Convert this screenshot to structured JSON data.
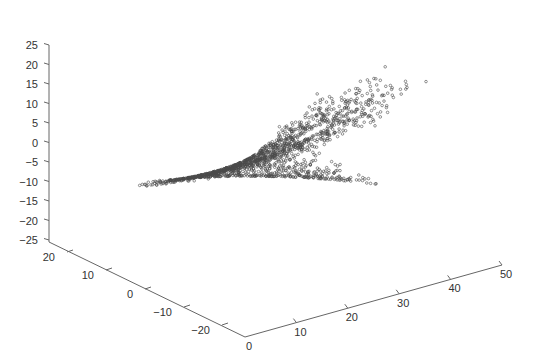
{
  "chart_data": {
    "type": "scatter3d",
    "title": "",
    "xlabel": "",
    "ylabel": "",
    "zlabel": "",
    "axes": {
      "x": {
        "range": [
          0,
          50
        ],
        "ticks": [
          0,
          10,
          20,
          30,
          40,
          50
        ]
      },
      "y": {
        "range": [
          -25,
          25
        ],
        "ticks": [
          20,
          10,
          0,
          -10,
          -20
        ]
      },
      "z": {
        "range": [
          -25,
          25
        ],
        "ticks": [
          25,
          20,
          15,
          10,
          5,
          0,
          -5,
          -10,
          -15,
          -20,
          -25
        ]
      }
    },
    "grid": false,
    "legend": null,
    "marker": {
      "shape": "circle-open",
      "color": "#555555",
      "size": 1.3
    },
    "series": [
      {
        "name": "lorenz",
        "system": {
          "sigma": 10,
          "rho": 28,
          "beta": 2.6667
        },
        "mapping": {
          "horizontal_axis": "z",
          "depth_axis": "y",
          "vertical_axis": "x"
        },
        "approx_points": 1400
      }
    ]
  },
  "labels": {
    "z_ticks": [
      "25",
      "20",
      "15",
      "10",
      "5",
      "0",
      "−5",
      "−10",
      "−15",
      "−20",
      "−25"
    ],
    "y_ticks": [
      "20",
      "10",
      "0",
      "−10",
      "−20"
    ],
    "x_ticks": [
      "0",
      "10",
      "20",
      "30",
      "40",
      "50"
    ]
  },
  "colors": {
    "axis": "#666666",
    "marker": "#4a4a4a",
    "text": "#333333"
  }
}
